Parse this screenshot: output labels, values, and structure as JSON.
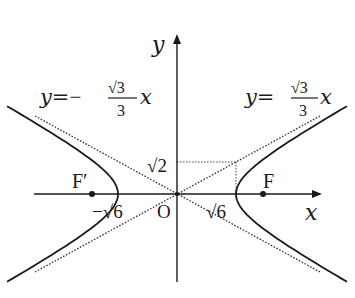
{
  "diagram": {
    "type": "hyperbola",
    "equation_params": {
      "a": "√6",
      "b": "√2",
      "c": "2√2"
    },
    "axes": {
      "x_label": "x",
      "y_label": "y",
      "origin_label": "O"
    },
    "foci": {
      "left": "F′",
      "right": "F"
    },
    "asymptotes": {
      "left": {
        "lhs": "y=",
        "sign": "−",
        "num": "√3",
        "den": "3",
        "var": "x"
      },
      "right": {
        "lhs": "y=",
        "sign": "",
        "num": "√3",
        "den": "3",
        "var": "x"
      }
    },
    "tick_labels": {
      "neg_vertex": "−√6",
      "pos_vertex": "√6",
      "b_value": "√2"
    },
    "colors": {
      "ink": "#1a1a1a",
      "dotted": "#333333"
    }
  }
}
